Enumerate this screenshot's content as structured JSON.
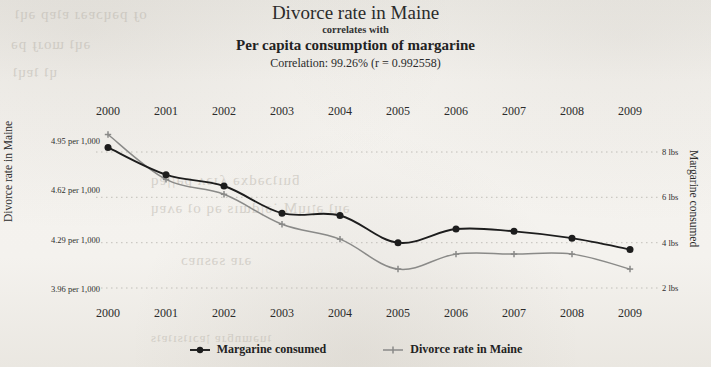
{
  "title": {
    "main": "Divorce rate in Maine",
    "connector": "correlates with",
    "sub": "Per capita consumption of margarine",
    "correlation": "Correlation: 99.26% (r = 0.992558)"
  },
  "axes": {
    "left_title": "Divorce rate in Maine",
    "right_title": "Margarine consumed",
    "left_ticks": [
      "4.95 per 1,000",
      "4.62 per 1,000",
      "4.29 per 1,000",
      "3.96 per 1,000"
    ],
    "right_ticks": [
      "8 lbs",
      "6 lbs",
      "4 lbs",
      "2 lbs"
    ]
  },
  "legend": [
    {
      "label": "Margarine consumed",
      "color": "#1d1d1d"
    },
    {
      "label": "Divorce rate in Maine",
      "color": "#8a8a88"
    }
  ],
  "chart_data": {
    "type": "line",
    "title": "Divorce rate in Maine correlates with Per capita consumption of margarine",
    "subtitle": "Correlation: 99.26% (r = 0.992558)",
    "xlabel": "",
    "categories": [
      "2000",
      "2001",
      "2002",
      "2003",
      "2004",
      "2005",
      "2006",
      "2007",
      "2008",
      "2009"
    ],
    "grid": true,
    "legend_position": "bottom",
    "series": [
      {
        "name": "Margarine consumed",
        "axis": "right",
        "unit": "lbs",
        "color": "#1d1d1d",
        "ylabel": "Margarine consumed",
        "ylim": [
          2,
          8
        ],
        "yticks": [
          2,
          4,
          6,
          8
        ],
        "values": [
          8.2,
          7.0,
          6.5,
          5.3,
          5.2,
          4.0,
          4.6,
          4.5,
          4.2,
          3.7
        ]
      },
      {
        "name": "Divorce rate in Maine",
        "axis": "left",
        "unit": "per 1,000",
        "color": "#8a8a88",
        "ylabel": "Divorce rate in Maine",
        "ylim": [
          3.96,
          4.95
        ],
        "yticks": [
          3.96,
          4.29,
          4.62,
          4.95
        ],
        "values": [
          5.0,
          4.7,
          4.6,
          4.4,
          4.3,
          4.1,
          4.2,
          4.2,
          4.2,
          4.1
        ]
      }
    ]
  }
}
